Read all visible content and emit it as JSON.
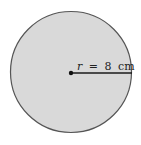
{
  "diagram": {
    "type": "circle",
    "center": {
      "x": 71,
      "y": 73
    },
    "radius_px": 61,
    "fill_color": "#d8d8d8",
    "stroke_color": "#555555",
    "radius_line": {
      "label": "r = 8 cm",
      "variable": "r",
      "equals": "=",
      "value": "8",
      "unit": "cm"
    }
  }
}
